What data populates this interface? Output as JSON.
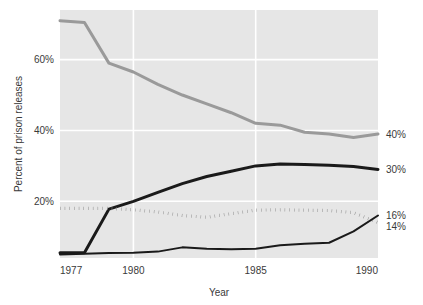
{
  "chart_data": {
    "type": "line",
    "title": "",
    "xlabel": "Year",
    "ylabel": "Percent of prison releases",
    "xlim": [
      1977,
      1990
    ],
    "ylim": [
      4,
      74
    ],
    "grid": true,
    "legend_position": "none",
    "xticks": [
      "1977",
      "1980",
      "1985",
      "1990"
    ],
    "xtick_values": [
      1977,
      1980,
      1985,
      1990
    ],
    "yticks": [
      "20%",
      "40%",
      "60%"
    ],
    "ytick_values": [
      20,
      40,
      60
    ],
    "x": [
      1977,
      1978,
      1979,
      1980,
      1981,
      1982,
      1983,
      1984,
      1985,
      1986,
      1987,
      1988,
      1989,
      1990
    ],
    "series": [
      {
        "name": "gray-declining-line",
        "style": "solid",
        "color": "#9a9a9a",
        "width": 3,
        "end_label": "40%",
        "values": [
          71,
          70.5,
          59,
          56.5,
          53,
          50,
          47.5,
          45,
          42,
          41.5,
          39.5,
          39,
          38,
          39
        ]
      },
      {
        "name": "black-rising-thick-line",
        "style": "solid",
        "color": "#1a1a1a",
        "width": 3,
        "end_label": "30%",
        "values": [
          5.5,
          5.5,
          17.8,
          20,
          22.5,
          25,
          27,
          28.5,
          30,
          30.5,
          30.4,
          30.2,
          29.8,
          29
        ]
      },
      {
        "name": "gray-dotted-line",
        "style": "dotted",
        "color": "#8a8a8a",
        "width": 3,
        "end_label": "14%",
        "values": [
          18,
          18,
          18,
          17.6,
          17,
          16,
          15.5,
          16.5,
          17.5,
          17.6,
          17.5,
          17.4,
          16.8,
          14
        ]
      },
      {
        "name": "black-rising-thin-line",
        "style": "solid",
        "color": "#1a1a1a",
        "width": 2,
        "end_label": "16%",
        "values": [
          5,
          5.2,
          5.4,
          5.5,
          5.8,
          7,
          6.6,
          6.5,
          6.6,
          7.6,
          8,
          8.3,
          11.5,
          16
        ]
      }
    ],
    "right_labels": [
      {
        "text": "40%",
        "value": 39
      },
      {
        "text": "30%",
        "value": 29
      },
      {
        "text": "16%",
        "value": 16
      },
      {
        "text": "14%",
        "value": 13
      }
    ]
  }
}
